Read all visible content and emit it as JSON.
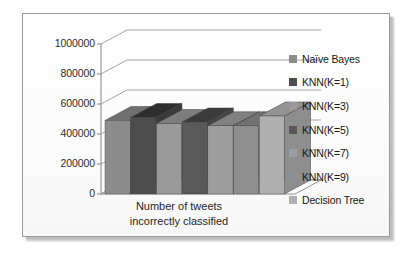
{
  "chart_data": {
    "type": "bar",
    "title": "",
    "subtitle": "",
    "xlabel": "Number of tweets incorrectly classified",
    "xlabel_lines": [
      "Number of tweets",
      "incorrectly classified"
    ],
    "ylabel": "",
    "categories": [
      "Number of tweets incorrectly classified"
    ],
    "ylim": [
      0,
      1000000
    ],
    "ytick_labels": [
      "0",
      "200000",
      "400000",
      "600000",
      "800000",
      "1000000"
    ],
    "ytick_values": [
      0,
      200000,
      400000,
      600000,
      800000,
      1000000
    ],
    "grid": true,
    "grid_orientation": "horizontal",
    "three_d": true,
    "legend_position": "right",
    "series": [
      {
        "name": "Naïve Bayes",
        "value": 490000,
        "color": "#8c8c8c",
        "top_color": "#6f6f6f",
        "side_color": "#6b6b6b"
      },
      {
        "name": "KNN(K=1)",
        "value": 510000,
        "color": "#4d4d4d",
        "top_color": "#2e2e2e",
        "side_color": "#3a3a3a"
      },
      {
        "name": "KNN(K=3)",
        "value": 470000,
        "color": "#9a9a9a",
        "top_color": "#7d7d7d",
        "side_color": "#787878"
      },
      {
        "name": "KNN(K=5)",
        "value": 480000,
        "color": "#595959",
        "top_color": "#3b3b3b",
        "side_color": "#454545"
      },
      {
        "name": "KNN(K=7)",
        "value": 455000,
        "color": "#9e9e9e",
        "top_color": "#818181",
        "side_color": "#7c7c7c"
      },
      {
        "name": "KNN(K=9)",
        "value": 455000,
        "color": "#8f8f8f",
        "top_color": "#727272",
        "side_color": "#6e6e6e"
      },
      {
        "name": "Decision Tree",
        "value": 520000,
        "color": "#b0b0b0",
        "top_color": "#939393",
        "side_color": "#8e8e8e"
      }
    ]
  },
  "legend": {
    "items": [
      {
        "label": "Naïve Bayes",
        "swatch": "#8c8c8c"
      },
      {
        "label": "KNN(K=1)",
        "swatch": "#4d4d4d"
      },
      {
        "label": "KNN(K=3)",
        "swatch": "#9a9a9a"
      },
      {
        "label": "KNN(K=5)",
        "swatch": "#595959"
      },
      {
        "label": "KNN(K=7)",
        "swatch": "#9e9e9e"
      },
      {
        "label": "KNN(K=9)",
        "swatch": "#8f8f8f"
      },
      {
        "label": "Decision Tree",
        "swatch": "#b0b0b0"
      }
    ]
  },
  "axis": {
    "y_ticks": [
      "1000000",
      "800000",
      "600000",
      "400000",
      "200000",
      "0"
    ],
    "x_title_line1": "Number of tweets",
    "x_title_line2": "incorrectly classified"
  },
  "colors": {
    "frame_border": "#9a9a9a",
    "gridline": "#9b9b9b",
    "axis_line": "#8f8f8f",
    "text": "#1f1f1f",
    "background": "#ffffff"
  }
}
